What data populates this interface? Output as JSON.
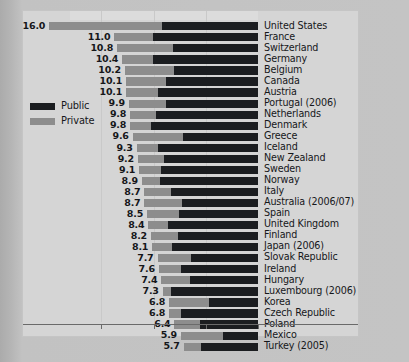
{
  "legend": {
    "position": "left-middle",
    "entries": [
      {
        "label": "Public",
        "color": "#1b1d20",
        "icon": "legend-swatch-public"
      },
      {
        "label": "Private",
        "color": "#8d8d8d",
        "icon": "legend-swatch-private"
      }
    ]
  },
  "footnote": {
    "text": ""
  },
  "chart_data": {
    "type": "bar",
    "orientation": "horizontal",
    "stacked": true,
    "bar_alignment": "right-aligned",
    "title": "",
    "subtitle": "",
    "xlabel": "",
    "ylabel": "",
    "xlim": [
      0,
      17
    ],
    "grid": true,
    "gridlines_x": [
      4,
      8,
      12
    ],
    "axis_tick_labels": [],
    "legend_position": "left-middle",
    "series": [
      {
        "name": "Public",
        "color": "#1b1d20"
      },
      {
        "name": "Private",
        "color": "#8d8d8d"
      }
    ],
    "categories": [
      "United States",
      "France",
      "Switzerland",
      "Germany",
      "Belgium",
      "Canada",
      "Austria",
      "Portugal (2006)",
      "Netherlands",
      "Denmark",
      "Greece",
      "Iceland",
      "New Zealand",
      "Sweden",
      "Norway",
      "Italy",
      "Australia (2006/07)",
      "Spain",
      "United Kingdom",
      "Finland",
      "Japan (2006)",
      "Slovak Republic",
      "Ireland",
      "Hungary",
      "Luxembourg (2006)",
      "Korea",
      "Czech Republic",
      "Poland",
      "Mexico",
      "Turkey (2005)"
    ],
    "values": [
      16.0,
      11.0,
      10.8,
      10.4,
      10.2,
      10.1,
      10.1,
      9.9,
      9.8,
      9.8,
      9.6,
      9.3,
      9.2,
      9.1,
      8.9,
      8.7,
      8.7,
      8.5,
      8.4,
      8.2,
      8.1,
      7.7,
      7.6,
      7.4,
      7.3,
      6.8,
      6.8,
      6.4,
      5.9,
      5.7
    ],
    "value_labels": [
      "16.0",
      "11.0",
      "10.8",
      "10.4",
      "10.2",
      "10.1",
      "10.1",
      "9.9",
      "9.8",
      "9.8",
      "9.6",
      "9.3",
      "9.2",
      "9.1",
      "8.9",
      "8.7",
      "8.7",
      "8.5",
      "8.4",
      "8.2",
      "8.1",
      "7.7",
      "7.6",
      "7.4",
      "7.3",
      "6.8",
      "6.8",
      "6.4",
      "5.9",
      "5.7"
    ],
    "private_share": [
      0.54,
      0.27,
      0.4,
      0.23,
      0.37,
      0.3,
      0.24,
      0.29,
      0.2,
      0.16,
      0.4,
      0.18,
      0.22,
      0.18,
      0.16,
      0.23,
      0.33,
      0.29,
      0.18,
      0.25,
      0.19,
      0.33,
      0.22,
      0.3,
      0.09,
      0.45,
      0.13,
      0.3,
      0.55,
      0.24
    ]
  }
}
